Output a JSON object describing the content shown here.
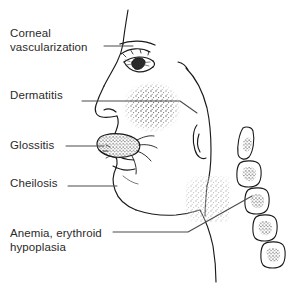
{
  "figure": {
    "background_color": "#ffffff",
    "ink_color": "#1a1a1a",
    "text_color": "#2a2a2a",
    "width": 300,
    "height": 288
  },
  "labels": {
    "corneal": {
      "line1": "Corneal",
      "line2": "vascularization"
    },
    "dermatitis": {
      "line1": "Dermatitis"
    },
    "glossitis": {
      "line1": "Glossitis"
    },
    "cheilosis": {
      "line1": "Cheilosis"
    },
    "anemia": {
      "line1": "Anemia, erythroid",
      "line2": "hypoplasia"
    }
  },
  "illustration": {
    "subject": "human-head-profile-facing-left",
    "features": [
      {
        "name": "eye",
        "finding": "corneal vascularization"
      },
      {
        "name": "cheek",
        "finding": "dermatitis",
        "texture": "stipple"
      },
      {
        "name": "tongue",
        "finding": "glossitis",
        "texture": "stipple"
      },
      {
        "name": "lips",
        "finding": "cheilosis"
      },
      {
        "name": "vertebrae",
        "finding": "anemia, erythroid hypoplasia",
        "count": 5,
        "texture": "stipple-marrow"
      }
    ]
  }
}
